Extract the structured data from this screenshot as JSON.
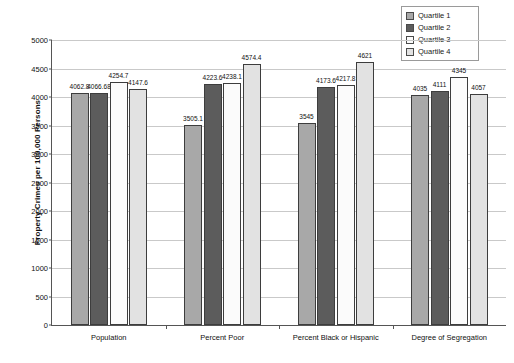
{
  "chart_data": {
    "type": "bar",
    "title": "",
    "subtitle": "",
    "xlabel": "",
    "ylabel": "Property Crimes per 100,000 Persons",
    "ylim": [
      0,
      5000
    ],
    "ytick_step": 500,
    "yticks": [
      "0",
      "500",
      "1000",
      "1500",
      "2000",
      "2500",
      "3000",
      "3500",
      "4000",
      "4500",
      "5000"
    ],
    "grid": true,
    "legend_position": "top-right",
    "categories": [
      "Population",
      "Percent Poor",
      "Percent Black or Hispanic",
      "Degree of Segregation"
    ],
    "series": [
      {
        "name": "Quartile 1",
        "color": "#a8a8a8",
        "values": [
          4062.8,
          3505.1,
          3545,
          4035
        ],
        "labels": [
          "4062.8",
          "3505.1",
          "3545",
          "4035"
        ]
      },
      {
        "name": "Quartile 2",
        "color": "#5c5c5c",
        "values": [
          4066.68,
          4223.6,
          4173.6,
          4111
        ],
        "labels": [
          "4066.68",
          "4223.6",
          "4173.6",
          "4111"
        ]
      },
      {
        "name": "Quartile 3",
        "color": "#fbfbfb",
        "values": [
          4254.7,
          4238.1,
          4217.8,
          4345
        ],
        "labels": [
          "4254.7",
          "4238.1",
          "4217.8",
          "4345"
        ]
      },
      {
        "name": "Quartile 4",
        "color": "#e2e2e2",
        "values": [
          4147.6,
          4574.4,
          4621,
          4057
        ],
        "labels": [
          "4147.6",
          "4574.4",
          "4621",
          "4057"
        ]
      }
    ]
  },
  "legend": {
    "items": [
      {
        "label": "Quartile 1",
        "color": "#a8a8a8"
      },
      {
        "label": "Quartile 2",
        "color": "#5c5c5c"
      },
      {
        "label": "Quartile 3",
        "color": "#fbfbfb"
      },
      {
        "label": "Quartile 4",
        "color": "#e2e2e2"
      }
    ]
  },
  "axes": {
    "y_title": "Property Crimes per 100,000 Persons"
  }
}
